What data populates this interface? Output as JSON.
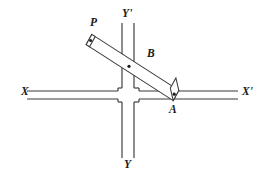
{
  "figure": {
    "type": "geometry-diagram",
    "background_color": "#ffffff",
    "ink_color": "#3a3a3a",
    "label_color": "#1a1a1a"
  },
  "labels": {
    "x_left": "X",
    "x_right": "X'",
    "y_top": "Y'",
    "y_bottom": "Y",
    "point_p": "P",
    "point_b": "B",
    "point_a": "A"
  },
  "geometry": {
    "horizontal_axis": {
      "name": "XX'",
      "line_top_y": 91,
      "line_bottom_y": 99,
      "x_start": 27,
      "x_end": 238,
      "gap_start_x": 118,
      "gap_end_x": 139
    },
    "vertical_axis": {
      "name": "YY'",
      "line_left_x": 122,
      "line_right_x": 134,
      "y_start": 23,
      "y_end": 158,
      "gap_start_y": 88,
      "gap_end_y": 102
    },
    "ruler": {
      "name": "PA",
      "end_p": {
        "x": 89,
        "y": 39
      },
      "end_a": {
        "x": 176,
        "y": 95
      },
      "half_width": 4.4,
      "cap_length": 4.0
    },
    "points": [
      {
        "label": "P",
        "x": 90.5,
        "y": 40.5
      },
      {
        "label": "B",
        "x": 129,
        "y": 66
      },
      {
        "label": "A",
        "x": 174,
        "y": 94
      }
    ]
  },
  "label_positions": {
    "x_left": {
      "left": 21,
      "top": 86
    },
    "x_right": {
      "left": 242,
      "top": 86
    },
    "y_top": {
      "left": 122,
      "top": 8
    },
    "y_bottom": {
      "left": 124,
      "top": 159
    },
    "point_p": {
      "left": 90,
      "top": 17
    },
    "point_b": {
      "left": 147,
      "top": 48
    },
    "point_a": {
      "left": 169,
      "top": 104
    }
  }
}
